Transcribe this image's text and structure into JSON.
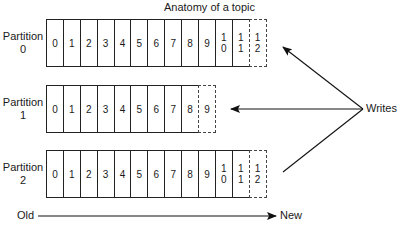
{
  "title": "Anatomy of a topic",
  "partitions": [
    {
      "label_line1": "Partition",
      "label_line2": "0",
      "offsets": [
        "0",
        "1",
        "2",
        "3",
        "4",
        "5",
        "6",
        "7",
        "8",
        "9",
        "10",
        "11",
        "12"
      ],
      "next_write_offset": "12"
    },
    {
      "label_line1": "Partition",
      "label_line2": "1",
      "offsets": [
        "0",
        "1",
        "2",
        "3",
        "4",
        "5",
        "6",
        "7",
        "8",
        "9"
      ],
      "next_write_offset": "9"
    },
    {
      "label_line1": "Partition",
      "label_line2": "2",
      "offsets": [
        "0",
        "1",
        "2",
        "3",
        "4",
        "5",
        "6",
        "7",
        "8",
        "9",
        "10",
        "11",
        "12"
      ],
      "next_write_offset": "12"
    }
  ],
  "writes_label": "Writes",
  "time_axis": {
    "start_label": "Old",
    "end_label": "New"
  }
}
